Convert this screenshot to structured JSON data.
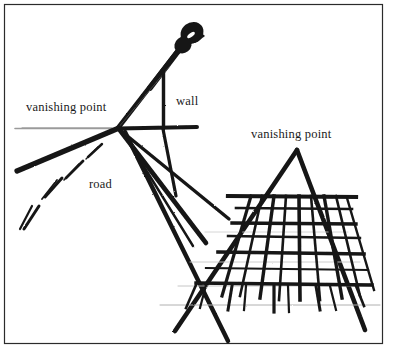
{
  "figure": {
    "background_color": "#ffffff",
    "ink_color": "#151515",
    "faint_ink_color": "#9a9a9a",
    "border": {
      "name": "figure-border",
      "color": "#2b2b2b",
      "x": 4,
      "y": 4,
      "width": 379,
      "height": 340,
      "stroke_width": 1.2
    },
    "labels": {
      "vanishing_point_left": "vanishing point",
      "vanishing_point_right": "vanishing point",
      "wall": "wall",
      "road": "road"
    },
    "vanishing_points": [
      {
        "name": "left-vanishing-point",
        "x": 118,
        "y": 128
      },
      {
        "name": "right-vanishing-point",
        "x": 297,
        "y": 149
      }
    ],
    "horizon_line": {
      "x1": 15,
      "y1": 128,
      "x2": 118,
      "y2": 128,
      "color": "#9a9a9a"
    },
    "street_scene": {
      "lamp_post": {
        "x1": 118,
        "y1": 128,
        "x2": 196,
        "y2": 22,
        "stroke_width": 4.5
      },
      "lamp_head": {
        "cx": 192,
        "cy": 33,
        "rx": 13,
        "ry": 11
      },
      "wall_vertical": {
        "x1": 163,
        "y1": 74,
        "x2": 163,
        "y2": 128,
        "stroke_width": 3
      },
      "wall_horizontal": {
        "x1": 118,
        "y1": 128,
        "x2": 196,
        "y2": 127,
        "stroke_width": 3.5
      },
      "wall_diagonal_faint": {
        "x1": 118,
        "y1": 128,
        "x2": 170,
        "y2": 66,
        "stroke_width": 0.8
      },
      "receding_rays": [
        {
          "name": "road-edge-left",
          "x1": 118,
          "y1": 128,
          "x2": 18,
          "y2": 170,
          "stroke_width": 5
        },
        {
          "name": "road-edge-mid",
          "x1": 118,
          "y1": 128,
          "x2": 205,
          "y2": 240,
          "stroke_width": 4.5
        },
        {
          "name": "road-edge-right",
          "x1": 118,
          "y1": 128,
          "x2": 228,
          "y2": 215,
          "stroke_width": 3.5
        },
        {
          "name": "curb-ray",
          "x1": 124,
          "y1": 131,
          "x2": 225,
          "y2": 340,
          "stroke_width": 4
        }
      ],
      "road_dashes": [
        {
          "name": "road-dash-1",
          "x1": 101,
          "y1": 145,
          "x2": 88,
          "y2": 156,
          "stroke_width": 2.6
        },
        {
          "name": "road-dash-2",
          "x1": 82,
          "y1": 162,
          "x2": 66,
          "y2": 177,
          "stroke_width": 3
        },
        {
          "name": "road-dash-3",
          "x1": 62,
          "y1": 178,
          "x2": 45,
          "y2": 196,
          "stroke_width": 3.4
        },
        {
          "name": "road-dash-4",
          "x1": 38,
          "y1": 205,
          "x2": 22,
          "y2": 228,
          "stroke_width": 3.8
        }
      ]
    },
    "building_scene": {
      "apex": {
        "x": 297,
        "y": 149
      },
      "left_edge": {
        "x1": 297,
        "y1": 149,
        "x2": 176,
        "y2": 330,
        "stroke_width": 4.5
      },
      "right_edge": {
        "x1": 297,
        "y1": 149,
        "x2": 364,
        "y2": 330,
        "stroke_width": 4.5
      },
      "facade": {
        "top_cornice_y": 196,
        "base_y": 296,
        "verticals": [
          {
            "name": "facade-vertical-1",
            "x_top": 252,
            "x_bottom": 223
          },
          {
            "name": "facade-vertical-2",
            "x_top": 272,
            "x_bottom": 257
          },
          {
            "name": "facade-vertical-3",
            "x_top": 290,
            "x_bottom": 283
          },
          {
            "name": "facade-vertical-4",
            "x_top": 307,
            "x_bottom": 312
          },
          {
            "name": "facade-vertical-5",
            "x_top": 325,
            "x_bottom": 343
          },
          {
            "name": "facade-vertical-6",
            "x_top": 341,
            "x_bottom": 371
          }
        ],
        "floor_lines_y": [
          196,
          206,
          222,
          232,
          248,
          262,
          280,
          296
        ],
        "receding_guides_count": 4
      }
    }
  }
}
